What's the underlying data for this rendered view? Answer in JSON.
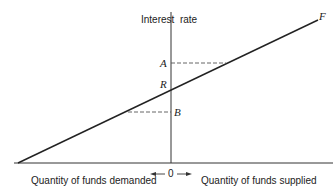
{
  "diagram": {
    "type": "supply-demand-loanable-funds",
    "y_axis_label": "Interest  rate",
    "x_axis_left_label": "Quantity of funds demanded",
    "x_axis_right_label": "Quantity of funds supplied",
    "origin_label": "0",
    "curve_label": "F",
    "points": [
      {
        "label": "A",
        "description": "interest rate above R"
      },
      {
        "label": "R",
        "description": "intercept of F on interest rate axis"
      },
      {
        "label": "B",
        "description": "interest rate below R"
      }
    ],
    "colors": {
      "line": "#222222",
      "dashed": "#555555",
      "axis": "#333333"
    }
  }
}
